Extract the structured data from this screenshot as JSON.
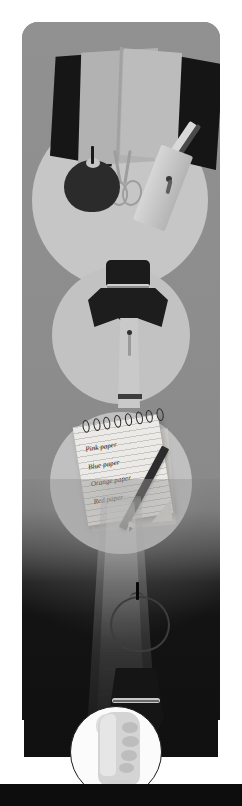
{
  "illustration": {
    "title": "Back to school grayscale collage",
    "style": "flat vector illustration, grayscale",
    "orientation": "vertical poster / card"
  },
  "palette": {
    "card_background": "#8b8b8b",
    "circle_light": "#c4c4c4",
    "dark_bottom": "#101010",
    "paper_white": "#eceae6",
    "ink_black": "#141414",
    "page_white": "#ffffff"
  },
  "scenes": [
    {
      "id": "supplies",
      "label": "school-supplies-scene",
      "caption": "",
      "objects": [
        "paper sheets",
        "apple",
        "scissors",
        "ruler",
        "pen",
        "key"
      ]
    },
    {
      "id": "uniform",
      "label": "uniform-tie-scene",
      "caption": "",
      "objects": [
        "collar",
        "scarf tie",
        "shirt",
        "cuff"
      ]
    },
    {
      "id": "notepad",
      "label": "notepad-list-scene",
      "caption": "",
      "objects": [
        "spiral notepad",
        "pencil"
      ]
    },
    {
      "id": "spotlight",
      "label": "dark-spotlight-scene",
      "caption": "",
      "objects": [
        "apple outline",
        "light beam"
      ]
    },
    {
      "id": "hand",
      "label": "hand-holding-scene",
      "caption": "",
      "objects": [
        "sleeve",
        "cuff",
        "fist",
        "held object"
      ]
    }
  ],
  "notepad": {
    "lines": [
      "Pink paper",
      "Blue paper",
      "Orange paper",
      "Red paper"
    ]
  }
}
